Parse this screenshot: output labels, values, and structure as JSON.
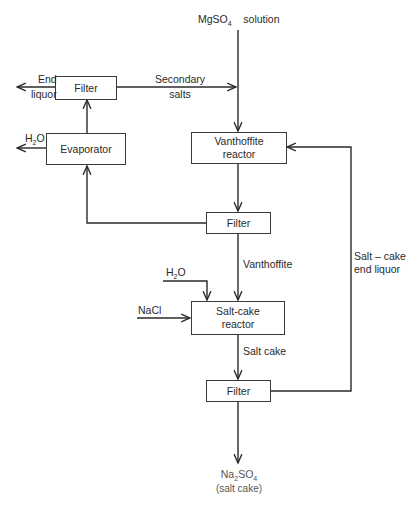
{
  "diagram": {
    "type": "process-flow",
    "nodes": {
      "filter_top": {
        "label": "Filter"
      },
      "evaporator": {
        "label": "Evaporator"
      },
      "vanthoffite_reactor": {
        "line1": "Vanthoffite",
        "line2": "reactor"
      },
      "filter_mid": {
        "label": "Filter"
      },
      "saltcake_reactor": {
        "line1": "Salt-cake",
        "line2": "reactor"
      },
      "filter_bottom": {
        "label": "Filter"
      }
    },
    "labels": {
      "mgso4_formula": "MgSO",
      "mgso4_sub": "4",
      "mgso4_text": "solution",
      "end_liquor_line1": "End",
      "end_liquor_line2": "liquor",
      "secondary_salts_line1": "Secondary",
      "secondary_salts_line2": "salts",
      "h2o_top_h": "H",
      "h2o_top_sub": "2",
      "h2o_top_o": "O",
      "vanthoffite_stream": "Vanthoffite",
      "h2o_mid_h": "H",
      "h2o_mid_sub": "2",
      "h2o_mid_o": "O",
      "nacl": "NaCl",
      "salt_cake_stream": "Salt cake",
      "recycle_line1": "Salt – cake",
      "recycle_line2": "end  liquor",
      "product_na": "Na",
      "product_sub2": "2",
      "product_so": "SO",
      "product_sub4": "4",
      "product_desc": "(salt  cake)"
    },
    "edges": [
      {
        "from": "MgSO4 solution",
        "to": "vanthoffite_reactor"
      },
      {
        "from": "filter_top",
        "to": "vanthoffite_reactor",
        "label": "Secondary salts"
      },
      {
        "from": "filter_top",
        "to": "out",
        "label": "End liquor"
      },
      {
        "from": "evaporator",
        "to": "filter_top"
      },
      {
        "from": "evaporator",
        "to": "out",
        "label": "H2O"
      },
      {
        "from": "vanthoffite_reactor",
        "to": "filter_mid"
      },
      {
        "from": "filter_mid",
        "to": "evaporator"
      },
      {
        "from": "filter_mid",
        "to": "saltcake_reactor",
        "label": "Vanthoffite"
      },
      {
        "from": "H2O",
        "to": "saltcake_reactor"
      },
      {
        "from": "NaCl",
        "to": "saltcake_reactor"
      },
      {
        "from": "saltcake_reactor",
        "to": "filter_bottom",
        "label": "Salt cake"
      },
      {
        "from": "filter_bottom",
        "to": "vanthoffite_reactor",
        "label": "Salt-cake end liquor"
      },
      {
        "from": "filter_bottom",
        "to": "product",
        "label": "Na2SO4 (salt cake)"
      }
    ]
  }
}
